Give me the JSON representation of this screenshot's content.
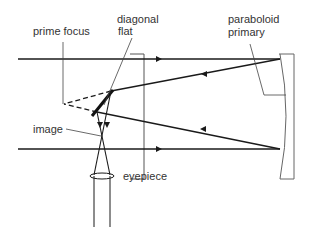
{
  "labels": {
    "prime_focus": "prime focus",
    "diagonal_line1": "diagonal",
    "diagonal_line2": "flat",
    "paraboloid_line1": "paraboloid",
    "paraboloid_line2": "primary",
    "image": "image",
    "eyepiece": "eyepiece"
  },
  "colors": {
    "ray": "#1a1a1a",
    "leader": "#444444",
    "mirror": "#555555",
    "text": "#333333"
  }
}
